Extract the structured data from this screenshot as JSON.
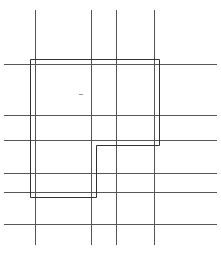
{
  "diagram": {
    "width": 221,
    "height": 254,
    "background": "#ffffff",
    "grid_color": "#555555",
    "outline_color": "#333333",
    "marker_color": "#999999",
    "vertical_lines": [
      {
        "x": 35.5,
        "y1": 10,
        "y2": 245
      },
      {
        "x": 91.5,
        "y1": 10,
        "y2": 245
      },
      {
        "x": 116.5,
        "y1": 10,
        "y2": 245
      },
      {
        "x": 154.5,
        "y1": 10,
        "y2": 245
      }
    ],
    "horizontal_lines": [
      {
        "y": 64.5,
        "x1": 4,
        "x2": 217
      },
      {
        "y": 115.5,
        "x1": 4,
        "x2": 217
      },
      {
        "y": 140.5,
        "x1": 4,
        "x2": 217
      },
      {
        "y": 173.5,
        "x1": 4,
        "x2": 217
      },
      {
        "y": 192.5,
        "x1": 4,
        "x2": 217
      },
      {
        "y": 224.5,
        "x1": 4,
        "x2": 217
      }
    ],
    "outline_polygon": "30.5,59.5 159.5,59.5 159.5,145.5 96.5,145.5 96.5,197.5 30.5,197.5",
    "marker": {
      "x1": 79,
      "y1": 94.5,
      "x2": 83,
      "y2": 94.5
    }
  }
}
